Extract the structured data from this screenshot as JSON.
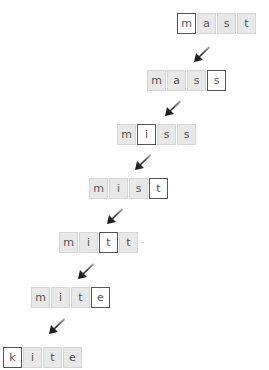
{
  "colors": {
    "box_fill": "#e8e8e8",
    "box_border": "#d6d6d6",
    "highlight_fill": "#ffffff",
    "highlight_border": "#555555",
    "letter": "#555555",
    "arrow": "#222222"
  },
  "rows": [
    {
      "word": "mast",
      "letters": [
        "m",
        "a",
        "s",
        "t"
      ],
      "highlight_index": 0
    },
    {
      "word": "mass",
      "letters": [
        "m",
        "a",
        "s",
        "s"
      ],
      "highlight_index": 3
    },
    {
      "word": "miss",
      "letters": [
        "m",
        "i",
        "s",
        "s"
      ],
      "highlight_index": 1
    },
    {
      "word": "mist",
      "letters": [
        "m",
        "i",
        "s",
        "t"
      ],
      "highlight_index": 3
    },
    {
      "word": "mitt",
      "letters": [
        "m",
        "i",
        "t",
        "t"
      ],
      "highlight_index": 2
    },
    {
      "word": "mite",
      "letters": [
        "m",
        "i",
        "t",
        "e"
      ],
      "highlight_index": 3
    },
    {
      "word": "kite",
      "letters": [
        "k",
        "i",
        "t",
        "e"
      ],
      "highlight_index": 0
    }
  ],
  "trailing_mark": "-"
}
